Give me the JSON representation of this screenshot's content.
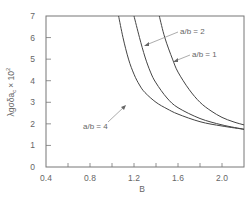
{
  "chart_data": {
    "type": "line",
    "title": "",
    "xlabel": "B",
    "ylabel": "λg σ δa_c × 10²",
    "xlim": [
      0.4,
      2.2
    ],
    "ylim": [
      0,
      7
    ],
    "x_ticks": [
      "0.4",
      "0.8",
      "1.2",
      "1.6",
      "2.0"
    ],
    "x_minor_ticks": [
      0.6,
      0.8,
      1.0,
      1.2,
      1.4,
      1.6,
      1.8,
      2.0
    ],
    "y_ticks": [
      "0",
      "1",
      "2",
      "3",
      "4",
      "5",
      "6",
      "7"
    ],
    "grid": false,
    "legend": "inline annotations",
    "series": [
      {
        "name": "a/b = 4",
        "x": [
          1.06,
          1.1,
          1.15,
          1.2,
          1.25,
          1.3,
          1.4,
          1.5,
          1.6,
          1.8,
          2.0,
          2.2
        ],
        "y": [
          7.0,
          6.0,
          5.0,
          4.3,
          3.8,
          3.45,
          3.0,
          2.7,
          2.45,
          2.1,
          1.9,
          1.75
        ]
      },
      {
        "name": "a/b = 2",
        "x": [
          1.2,
          1.25,
          1.3,
          1.35,
          1.4,
          1.5,
          1.6,
          1.8,
          2.0,
          2.2
        ],
        "y": [
          7.0,
          6.0,
          5.1,
          4.4,
          3.9,
          3.2,
          2.75,
          2.25,
          1.95,
          1.75
        ]
      },
      {
        "name": "a/b = 1",
        "x": [
          1.43,
          1.48,
          1.55,
          1.6,
          1.7,
          1.8,
          1.9,
          2.0,
          2.1,
          2.2
        ],
        "y": [
          7.0,
          6.0,
          5.0,
          4.4,
          3.6,
          3.0,
          2.6,
          2.3,
          2.1,
          1.95
        ]
      }
    ],
    "annotations": [
      {
        "text": "a/b = 2",
        "points_to": "a/b = 2"
      },
      {
        "text": "a/b = 1",
        "points_to": "a/b = 1"
      },
      {
        "text": "a/b = 4",
        "points_to": "a/b = 4"
      }
    ]
  },
  "labels": {
    "xlabel": "B",
    "ylabel": "λgσδa",
    "ylabel_sub": "c",
    "ylabel_suffix": "× 10",
    "ylabel_exp": "2",
    "annot_ab2": "a/b = 2",
    "annot_ab1": "a/b = 1",
    "annot_ab4": "a/b = 4"
  }
}
